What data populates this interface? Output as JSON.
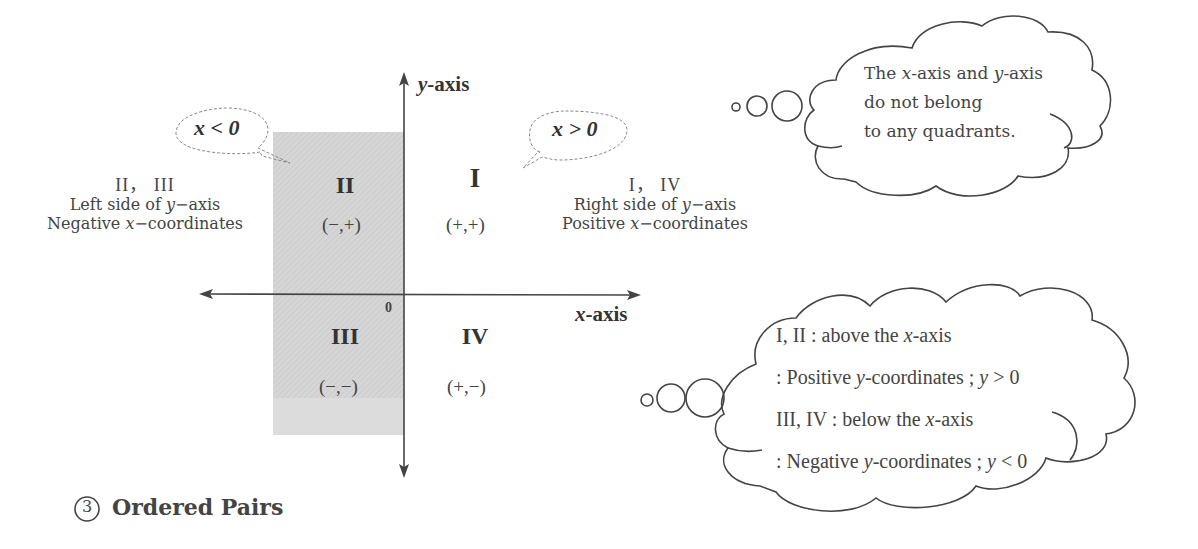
{
  "diagram": {
    "axes": {
      "y_label_var": "y",
      "y_label_suffix": "-axis",
      "x_label_var": "x",
      "x_label_suffix": "-axis",
      "origin": "0"
    },
    "quadrants": [
      {
        "numeral": "I",
        "signs": "(+,+)"
      },
      {
        "numeral": "II",
        "signs": "(−,+)"
      },
      {
        "numeral": "III",
        "signs": "(−,−)"
      },
      {
        "numeral": "IV",
        "signs": "(+,−)"
      }
    ],
    "callouts": {
      "left": "x < 0",
      "right": "x > 0"
    },
    "left_side": {
      "numerals": "II， III",
      "line1_pre": "Left side of ",
      "line1_var": "y",
      "line1_post": "−axis",
      "line2_pre": "Negative ",
      "line2_var": "x",
      "line2_post": "−coordinates"
    },
    "right_side": {
      "numerals": "I， IV",
      "line1_pre": "Right side of ",
      "line1_var": "y",
      "line1_post": "−axis",
      "line2_pre": "Positive ",
      "line2_var": "x",
      "line2_post": "−coordinates"
    },
    "shading_color": "#d9d9d9"
  },
  "thought_bubble_top": {
    "line1_pre": "The ",
    "line1_var1": "x",
    "line1_mid": "-axis and ",
    "line1_var2": "y",
    "line1_post": "-axis",
    "line2": "do not belong",
    "line3": "to any quadrants."
  },
  "thought_bubble_bottom": {
    "line1_pre": "I,  II : above the ",
    "line1_var": "x",
    "line1_post": "-axis",
    "line2_pre": ": Positive ",
    "line2_var": "y",
    "line2_mid": "-coordinates ;  ",
    "line2_var2": "y",
    "line2_post": " > 0",
    "line3_pre": "III, IV : below the ",
    "line3_var": "x",
    "line3_post": "-axis",
    "line4_pre": ": Negative ",
    "line4_var": "y",
    "line4_mid": "-coordinates ;  ",
    "line4_var2": "y",
    "line4_post": " < 0"
  },
  "section": {
    "number": "3",
    "title": "Ordered Pairs"
  }
}
